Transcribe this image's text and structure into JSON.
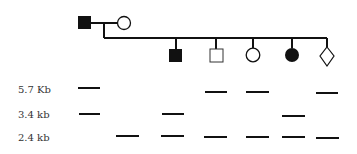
{
  "pedigree": {
    "parents": [
      {
        "id": "father",
        "shape": "square",
        "affected": true
      },
      {
        "id": "mother",
        "shape": "circle",
        "affected": false
      }
    ],
    "children": [
      {
        "id": "child-1",
        "shape": "square",
        "affected": true
      },
      {
        "id": "child-2",
        "shape": "square",
        "affected": false
      },
      {
        "id": "child-3",
        "shape": "circle",
        "affected": false
      },
      {
        "id": "child-4",
        "shape": "circle",
        "affected": true
      },
      {
        "id": "child-5",
        "shape": "diamond",
        "affected": false
      }
    ]
  },
  "gel": {
    "band_labels": [
      "5.7 Kb",
      "3.4 kb",
      "2.4 kb"
    ],
    "lanes": [
      {
        "individual": "father",
        "bands": [
          "5.7 Kb",
          "3.4 kb"
        ]
      },
      {
        "individual": "mother",
        "bands": [
          "2.4 kb"
        ]
      },
      {
        "individual": "child-1",
        "bands": [
          "3.4 kb",
          "2.4 kb"
        ]
      },
      {
        "individual": "child-2",
        "bands": [
          "5.7 Kb",
          "2.4 kb"
        ]
      },
      {
        "individual": "child-3",
        "bands": [
          "5.7 Kb",
          "2.4 kb"
        ]
      },
      {
        "individual": "child-4",
        "bands": [
          "3.4 kb",
          "2.4 kb"
        ]
      },
      {
        "individual": "child-5",
        "bands": [
          "5.7 Kb",
          "2.4 kb"
        ]
      }
    ]
  },
  "colors": {
    "ink": "#111111",
    "background": "#ffffff"
  }
}
